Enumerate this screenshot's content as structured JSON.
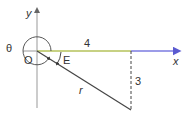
{
  "diagram": {
    "labels": {
      "y_axis": "y",
      "x_axis": "x",
      "theta": "θ",
      "origin": "O",
      "angle_e": "E",
      "horizontal_length": "4",
      "vertical_length": "3",
      "radius": "r"
    },
    "colors": {
      "axis": "#999999",
      "horizontal_segment": "#b5c25a",
      "x_axis_positive": "#7b7be0",
      "line": "#444444",
      "text": "#333333"
    },
    "point": {
      "x": 4,
      "y": -3
    }
  }
}
